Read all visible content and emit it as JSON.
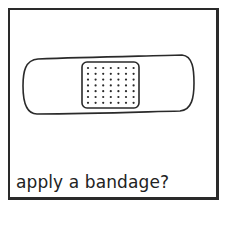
{
  "card": {
    "caption": "apply a bandage?",
    "illustration": "adhesive-bandage",
    "pad_dots": {
      "rows": 7,
      "cols": 7
    }
  },
  "colors": {
    "stroke": "#2a2a2a",
    "background": "#ffffff"
  }
}
